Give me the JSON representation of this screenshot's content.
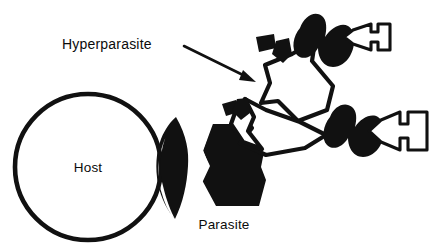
{
  "figure": {
    "kind": "biological-diagram",
    "title_visible": false,
    "background_color": "#ffffff",
    "ink_color": "#111111",
    "width": 433,
    "height": 251
  },
  "labels": {
    "host": "Host",
    "parasite": "Parasite",
    "hyperparasite": "Hyperparasite"
  },
  "organisms": [
    {
      "name": "host",
      "label": "Host",
      "style": "open-circle",
      "fill": "#ffffff",
      "stroke": "#111111"
    },
    {
      "name": "parasite",
      "label": "Parasite",
      "style": "solid-black",
      "fill": "#111111"
    },
    {
      "name": "hyperparasite",
      "label": "Hyperparasite",
      "style": "white-outline",
      "fill": "#ffffff",
      "stroke": "#111111"
    },
    {
      "name": "hyper-hyperparasite-upper",
      "label": "",
      "style": "solid-black-with-outline-tip",
      "fill": "#111111"
    },
    {
      "name": "hyper-hyperparasite-lower",
      "label": "",
      "style": "solid-black-with-outline-tip",
      "fill": "#111111"
    }
  ],
  "annotations": {
    "leader": {
      "from_label": "Hyperparasite",
      "arrow_head": "filled-triangle",
      "direction": "down-right"
    }
  }
}
